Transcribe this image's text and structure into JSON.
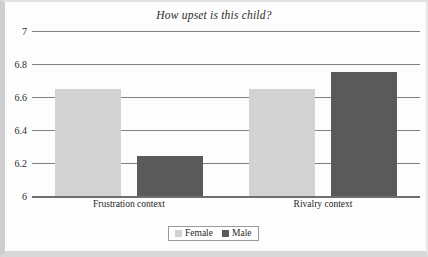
{
  "chart_data": {
    "type": "bar",
    "title": "How upset is this child?",
    "xlabel": "",
    "ylabel": "",
    "categories": [
      "Frustration context",
      "Rivalry context"
    ],
    "series": [
      {
        "name": "Female",
        "color": "#d2d2d2",
        "values": [
          6.65,
          6.65
        ]
      },
      {
        "name": "Male",
        "color": "#5a5a5a",
        "values": [
          6.24,
          6.75
        ]
      }
    ],
    "ylim": [
      6,
      7
    ],
    "yticks": [
      "6",
      "6.2",
      "6.4",
      "6.6",
      "6.8",
      "7"
    ],
    "ytick_values": [
      6,
      6.2,
      6.4,
      6.6,
      6.8,
      7
    ],
    "grid": true,
    "legend_position": "bottom"
  },
  "legend": {
    "entries": [
      {
        "label": "Female"
      },
      {
        "label": "Male"
      }
    ]
  },
  "colors": {
    "female": "#d2d2d2",
    "male": "#5a5a5a",
    "gridline": "#808080",
    "text": "#1f1f1f"
  }
}
